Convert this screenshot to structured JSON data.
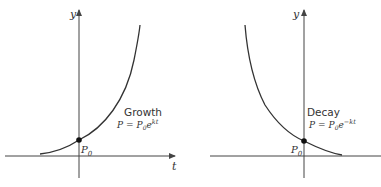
{
  "panels": [
    {
      "id": "growth",
      "title": "Growth",
      "formula": {
        "lhs": "P",
        "eq": "=",
        "base": "P",
        "sub": "0",
        "e": "e",
        "exp": "kt"
      },
      "y_axis_label": "y",
      "x_axis_label": "t",
      "point_label": {
        "base": "P",
        "sub": "0"
      }
    },
    {
      "id": "decay",
      "title": "Decay",
      "formula": {
        "lhs": "P",
        "eq": "=",
        "base": "P",
        "sub": "0",
        "e": "e",
        "exp": "−kt"
      },
      "y_axis_label": "y",
      "x_axis_label": "",
      "point_label": {
        "base": "P",
        "sub": "0"
      }
    }
  ],
  "colors": {
    "ink": "#333333",
    "background": "#ffffff"
  }
}
